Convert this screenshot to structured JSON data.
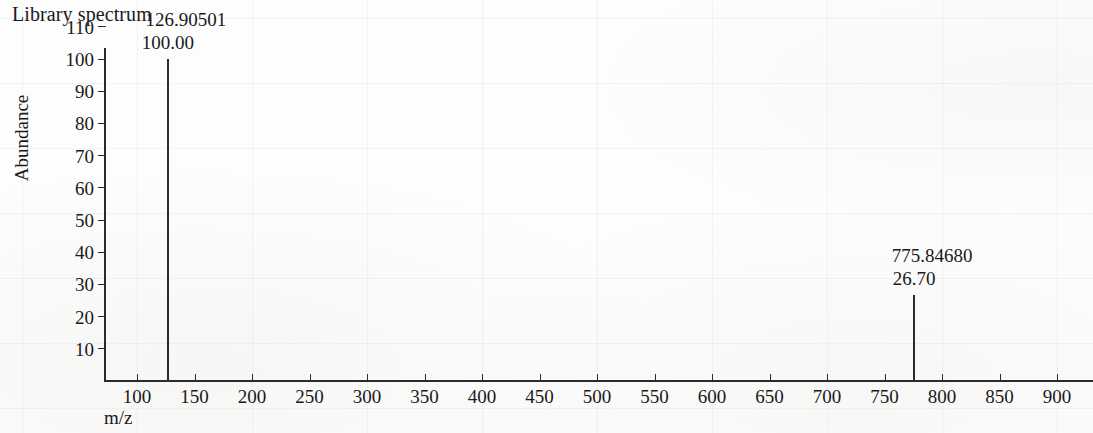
{
  "chart": {
    "title": "Library spectrum",
    "y_axis_title": "Abundance",
    "x_axis_title": "m/z"
  },
  "chart_data": {
    "type": "bar",
    "title": "Library spectrum",
    "xlabel": "m/z",
    "ylabel": "Abundance",
    "xlim": [
      75,
      935
    ],
    "ylim": [
      0,
      112
    ],
    "grid": "faint",
    "legend": "none",
    "x_ticks": [
      100,
      150,
      200,
      250,
      300,
      350,
      400,
      450,
      500,
      550,
      600,
      650,
      700,
      750,
      800,
      850,
      900
    ],
    "y_ticks": [
      10,
      20,
      30,
      40,
      50,
      60,
      70,
      80,
      90,
      100,
      110
    ],
    "peaks": [
      {
        "mz": 126.90501,
        "mz_label": "126.90501",
        "abundance": 100.0,
        "abundance_label": "100.00"
      },
      {
        "mz": 775.8468,
        "mz_label": "775.84680",
        "abundance": 26.7,
        "abundance_label": "26.70"
      }
    ]
  }
}
